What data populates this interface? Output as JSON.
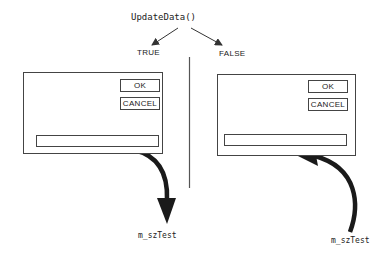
{
  "diagram": {
    "function_call": "UpdateData()",
    "branches": [
      {
        "label": "TRUE",
        "dialog": {
          "ok_label": "OK",
          "cancel_label": "CANCEL",
          "edit_value": ""
        },
        "variable": "m_szTest",
        "flow": "dialog-to-variable"
      },
      {
        "label": "FALSE",
        "dialog": {
          "ok_label": "OK",
          "cancel_label": "CANCEL",
          "edit_value": ""
        },
        "variable": "m_szTest",
        "flow": "variable-to-dialog"
      }
    ],
    "colors": {
      "line": "#444444",
      "arrow": "#1a1a1a",
      "background": "#ffffff"
    }
  }
}
